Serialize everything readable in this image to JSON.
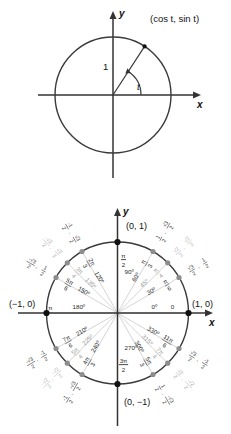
{
  "figure_top": {
    "name": "unit-circle-definition",
    "axis_x_label": "x",
    "axis_y_label": "y",
    "point_label": "(cos t, sin t)",
    "radius_label": "1",
    "angle_label": "t",
    "center": [
      113,
      95
    ],
    "radius": 58,
    "angle_degrees": 57
  },
  "figure_bottom": {
    "name": "unit-circle-values",
    "axis_x_label": "x",
    "axis_y_label": "y",
    "center": [
      117.5,
      313
    ],
    "radius": 71,
    "cardinal_points": [
      {
        "angle": 0,
        "label": "(1, 0)"
      },
      {
        "angle": 90,
        "label": "(0, 1)"
      },
      {
        "angle": 180,
        "label": "(−1, 0)"
      },
      {
        "angle": 270,
        "label": "(0, −1)"
      }
    ],
    "angles": [
      {
        "deg": "0º",
        "rad_num": "0",
        "rad_den": "",
        "rad_flat": "0",
        "x_num": "1",
        "x_den": "",
        "y_num": "0",
        "y_den": "",
        "value": 0
      },
      {
        "deg": "30º",
        "rad_num": "π",
        "rad_den": "6",
        "rad_flat": "",
        "x_num": "√3",
        "x_den": "2",
        "y_num": "1",
        "y_den": "2",
        "value": 30
      },
      {
        "deg": "45º",
        "rad_num": "π",
        "rad_den": "4",
        "rad_flat": "",
        "x_num": "√2",
        "x_den": "2",
        "y_num": "√2",
        "y_den": "2",
        "value": 45
      },
      {
        "deg": "60º",
        "rad_num": "π",
        "rad_den": "3",
        "rad_flat": "",
        "x_num": "1",
        "x_den": "2",
        "y_num": "√3",
        "y_den": "2",
        "value": 60
      },
      {
        "deg": "90º",
        "rad_num": "π",
        "rad_den": "2",
        "rad_flat": "",
        "x_num": "0",
        "x_den": "",
        "y_num": "1",
        "y_den": "",
        "value": 90
      },
      {
        "deg": "120º",
        "rad_num": "2π",
        "rad_den": "3",
        "rad_flat": "",
        "x_num": "-1",
        "x_den": "2",
        "y_num": "√3",
        "y_den": "2",
        "value": 120
      },
      {
        "deg": "135º",
        "rad_num": "3π",
        "rad_den": "4",
        "rad_flat": "",
        "x_num": "-√2",
        "x_den": "2",
        "y_num": "√2",
        "y_den": "2",
        "value": 135
      },
      {
        "deg": "150º",
        "rad_num": "5π",
        "rad_den": "6",
        "rad_flat": "",
        "x_num": "-√3",
        "x_den": "2",
        "y_num": "1",
        "y_den": "2",
        "value": 150
      },
      {
        "deg": "180º",
        "rad_num": "π",
        "rad_den": "",
        "rad_flat": "π",
        "x_num": "-1",
        "x_den": "",
        "y_num": "0",
        "y_den": "",
        "value": 180
      },
      {
        "deg": "210º",
        "rad_num": "7π",
        "rad_den": "6",
        "rad_flat": "",
        "x_num": "-√3",
        "x_den": "2",
        "y_num": "-1",
        "y_den": "2",
        "value": 210
      },
      {
        "deg": "225º",
        "rad_num": "5π",
        "rad_den": "4",
        "rad_flat": "",
        "x_num": "-√2",
        "x_den": "2",
        "y_num": "-√2",
        "y_den": "2",
        "value": 225
      },
      {
        "deg": "240º",
        "rad_num": "4π",
        "rad_den": "3",
        "rad_flat": "",
        "x_num": "-1",
        "x_den": "2",
        "y_num": "-√3",
        "y_den": "2",
        "value": 240
      },
      {
        "deg": "270º",
        "rad_num": "3π",
        "rad_den": "2",
        "rad_flat": "",
        "x_num": "0",
        "x_den": "",
        "y_num": "-1",
        "y_den": "",
        "value": 270
      },
      {
        "deg": "300º",
        "rad_num": "5π",
        "rad_den": "3",
        "rad_flat": "",
        "x_num": "1",
        "x_den": "2",
        "y_num": "-√3",
        "y_den": "2",
        "value": 300
      },
      {
        "deg": "315º",
        "rad_num": "7π",
        "rad_den": "4",
        "rad_flat": "",
        "x_num": "√2",
        "x_den": "2",
        "y_num": "-√2",
        "y_den": "2",
        "value": 315
      },
      {
        "deg": "330º",
        "rad_num": "11π",
        "rad_den": "6",
        "rad_flat": "",
        "x_num": "√3",
        "x_den": "2",
        "y_num": "-1",
        "y_den": "2",
        "value": 330
      }
    ]
  },
  "colors": {
    "axis": "#333333",
    "circle": "#3a3a3a",
    "spoke": "#c9c9c9",
    "dot_major": "#111111",
    "dot_minor": "#8d8d8d",
    "text": "#1a1a1a",
    "text_faded": "#9a9a9a"
  }
}
